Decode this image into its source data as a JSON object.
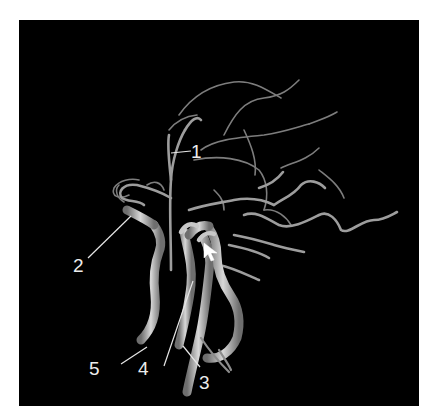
{
  "figure": {
    "type": "3D cerebral angiography rendering",
    "background_color": "#000000",
    "vessel_color": "#bdbdbd",
    "label_color": "#ececec",
    "labels": [
      {
        "id": "1",
        "text": "1"
      },
      {
        "id": "2",
        "text": "2"
      },
      {
        "id": "3",
        "text": "3"
      },
      {
        "id": "4",
        "text": "4"
      },
      {
        "id": "5",
        "text": "5"
      }
    ],
    "arrow": {
      "icon": "arrow-pointer-icon",
      "direction": "up-left"
    }
  }
}
